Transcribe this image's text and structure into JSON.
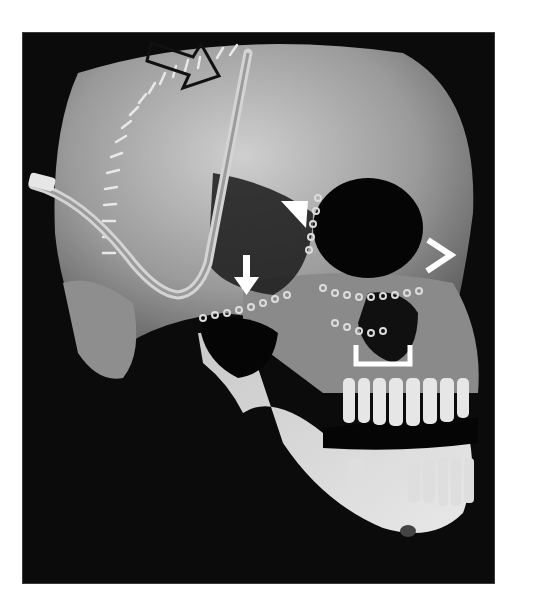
{
  "figure": {
    "background_color": "#ffffff",
    "frame_color": "#0b0b0b",
    "bone_color": "#bdbdbd",
    "annotation_color": "#ffffff",
    "annotations": [
      {
        "type": "open-arrow",
        "color": "#111111",
        "points_to": "coronal incision staples / skull vertex"
      },
      {
        "type": "arrowhead",
        "color": "#ffffff",
        "points_to": "medial orbital plate"
      },
      {
        "type": "down-arrow",
        "color": "#ffffff",
        "points_to": "zygomatic arch plate"
      },
      {
        "type": "angle-bracket",
        "color": "#ffffff",
        "points_to": "lateral orbital rim"
      },
      {
        "type": "square-bracket",
        "color": "#ffffff",
        "points_to": "maxillary plate"
      }
    ],
    "devices": [
      {
        "type": "drain-tube",
        "location": "temporal scalp"
      },
      {
        "type": "skin-staples",
        "location": "coronal incision"
      },
      {
        "type": "fixation-plates",
        "location": "orbit, zygoma, maxilla"
      }
    ]
  }
}
